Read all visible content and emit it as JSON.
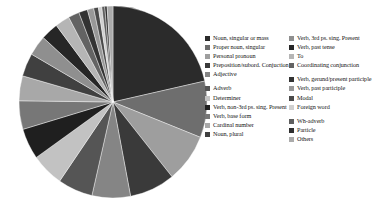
{
  "chart_data": {
    "type": "pie",
    "title": "",
    "subtitle": "",
    "xlabel": "",
    "ylabel": "",
    "legend_position": "right",
    "grid": false,
    "start_angle_deg": -90,
    "direction": "clockwise",
    "categories": [
      "Noun, singular or mass",
      "Proper noun, singular",
      "Personal pronoun",
      "Preposition/subord. Conjuction",
      "Adjective",
      "Adverb",
      "Determiner",
      "Verb, non-3rd ps. sing. Present",
      "Verb, base form",
      "Cardinal number",
      "Noun, plural",
      "Verb, 3rd ps. sing. Present",
      "Verb, past tense",
      "To",
      "Coordinating conjunction",
      "Verb, gerund/present participle",
      "Verb, past participle",
      "Modal",
      "Foreign word",
      "Wh-adverb",
      "Particle",
      "Others"
    ],
    "values": [
      21.5,
      9.5,
      8.2,
      7.8,
      6.6,
      6.0,
      5.6,
      5.2,
      4.8,
      4.2,
      3.9,
      3.4,
      3.0,
      2.5,
      1.9,
      1.5,
      1.1,
      0.8,
      0.6,
      0.5,
      0.4,
      1.0
    ],
    "colors": [
      "#2b2b2b",
      "#6e6e6e",
      "#9e9e9e",
      "#3a3a3a",
      "#858585",
      "#555555",
      "#c2c2c2",
      "#1f1f1f",
      "#777777",
      "#a8a8a8",
      "#404040",
      "#8f8f8f",
      "#262626",
      "#b5b5b5",
      "#636363",
      "#333333",
      "#989898",
      "#4a4a4a",
      "#d0d0d0",
      "#5e5e5e",
      "#2f2f2f",
      "#ababab"
    ]
  },
  "legend": {
    "columns": [
      {
        "name": "legend-column-left",
        "items": [
          {
            "label": "Noun, singular or mass",
            "color": "#2b2b2b",
            "spacer": false
          },
          {
            "label": "Proper noun, singular",
            "color": "#6e6e6e",
            "spacer": false
          },
          {
            "label": "Personal pronoun",
            "color": "#9e9e9e",
            "spacer": false
          },
          {
            "label": "Preposition/subord. Conjuction",
            "color": "#3a3a3a",
            "spacer": false
          },
          {
            "label": "Adjective",
            "color": "#858585",
            "spacer": false
          },
          {
            "label": "Adverb",
            "color": "#555555",
            "spacer": true
          },
          {
            "label": "Determiner",
            "color": "#c2c2c2",
            "spacer": false
          },
          {
            "label": "Verb, non-3rd ps. sing. Present",
            "color": "#1f1f1f",
            "spacer": false
          },
          {
            "label": "Verb, base form",
            "color": "#777777",
            "spacer": false
          },
          {
            "label": "Cardinal number",
            "color": "#a8a8a8",
            "spacer": false
          },
          {
            "label": "Noun, plural",
            "color": "#404040",
            "spacer": false
          }
        ]
      },
      {
        "name": "legend-column-right",
        "items": [
          {
            "label": "Verb, 3rd ps. sing. Present",
            "color": "#8f8f8f",
            "spacer": false
          },
          {
            "label": "Verb, past tense",
            "color": "#262626",
            "spacer": false
          },
          {
            "label": "To",
            "color": "#b5b5b5",
            "spacer": false
          },
          {
            "label": "Coordinating conjunction",
            "color": "#636363",
            "spacer": false
          },
          {
            "label": "Verb, gerund/present participle",
            "color": "#333333",
            "spacer": true
          },
          {
            "label": "Verb, past participle",
            "color": "#989898",
            "spacer": false
          },
          {
            "label": "Modal",
            "color": "#4a4a4a",
            "spacer": false
          },
          {
            "label": "Foreign word",
            "color": "#d0d0d0",
            "spacer": false
          },
          {
            "label": "Wh-adverb",
            "color": "#5e5e5e",
            "spacer": true
          },
          {
            "label": "Particle",
            "color": "#2f2f2f",
            "spacer": false
          },
          {
            "label": "Others",
            "color": "#ababab",
            "spacer": false
          }
        ]
      }
    ]
  }
}
